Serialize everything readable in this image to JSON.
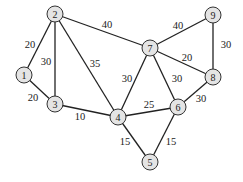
{
  "graph": {
    "nodes": [
      {
        "id": "1",
        "x": 24,
        "y": 75
      },
      {
        "id": "2",
        "x": 55,
        "y": 14
      },
      {
        "id": "3",
        "x": 55,
        "y": 104
      },
      {
        "id": "4",
        "x": 118,
        "y": 117
      },
      {
        "id": "5",
        "x": 150,
        "y": 162
      },
      {
        "id": "6",
        "x": 178,
        "y": 107
      },
      {
        "id": "7",
        "x": 150,
        "y": 48
      },
      {
        "id": "8",
        "x": 213,
        "y": 77
      },
      {
        "id": "9",
        "x": 213,
        "y": 15
      }
    ],
    "edges": [
      {
        "from": "1",
        "to": "2",
        "weight": "20",
        "lx": 30,
        "ly": 44
      },
      {
        "from": "1",
        "to": "3",
        "weight": "20",
        "lx": 33,
        "ly": 97
      },
      {
        "from": "2",
        "to": "3",
        "weight": "30",
        "lx": 46,
        "ly": 61
      },
      {
        "from": "2",
        "to": "4",
        "weight": "35",
        "lx": 95,
        "ly": 63
      },
      {
        "from": "2",
        "to": "7",
        "weight": "40",
        "lx": 107,
        "ly": 24
      },
      {
        "from": "3",
        "to": "4",
        "weight": "10",
        "lx": 80,
        "ly": 116
      },
      {
        "from": "4",
        "to": "7",
        "weight": "30",
        "lx": 127,
        "ly": 78
      },
      {
        "from": "4",
        "to": "6",
        "weight": "25",
        "lx": 149,
        "ly": 104
      },
      {
        "from": "4",
        "to": "5",
        "weight": "15",
        "lx": 125,
        "ly": 141
      },
      {
        "from": "5",
        "to": "6",
        "weight": "15",
        "lx": 171,
        "ly": 141
      },
      {
        "from": "6",
        "to": "7",
        "weight": "30",
        "lx": 177,
        "ly": 78
      },
      {
        "from": "6",
        "to": "8",
        "weight": "30",
        "lx": 201,
        "ly": 98
      },
      {
        "from": "7",
        "to": "8",
        "weight": "20",
        "lx": 187,
        "ly": 57
      },
      {
        "from": "7",
        "to": "9",
        "weight": "40",
        "lx": 178,
        "ly": 25
      },
      {
        "from": "9",
        "to": "8",
        "weight": "30",
        "lx": 226,
        "ly": 44
      }
    ]
  }
}
